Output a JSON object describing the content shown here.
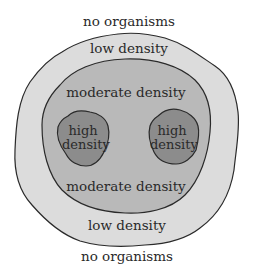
{
  "diagram": {
    "type": "population density zones",
    "colors": {
      "background": "#ffffff",
      "low_density_fill": "#dcdcdc",
      "moderate_density_fill": "#b9b9b9",
      "high_density_fill": "#8c8c8c",
      "outline": "#2a2a2a"
    },
    "labels": {
      "top_outside": "no organisms",
      "top_low": "low density",
      "top_moderate": "moderate density",
      "high_left_line1": "high",
      "high_left_line2": "density",
      "high_right_line1": "high",
      "high_right_line2": "density",
      "bottom_moderate": "moderate density",
      "bottom_low": "low density",
      "bottom_outside": "no organisms"
    }
  }
}
